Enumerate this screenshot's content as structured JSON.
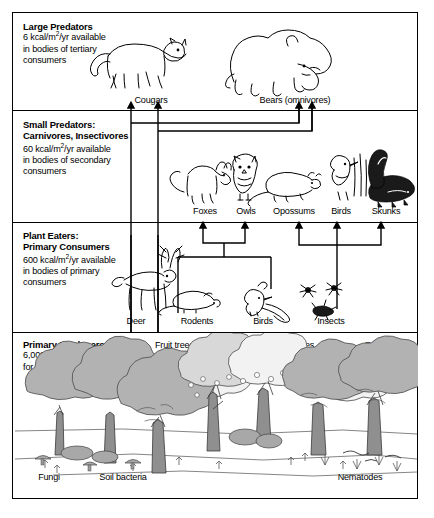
{
  "diagram": {
    "accent_color": "#000000",
    "background_color": "#ffffff"
  },
  "tiers": [
    {
      "id": "large-predators",
      "title": "Large Predators",
      "line1_pre": "6 kcal/m",
      "line1_sup": "2",
      "line1_post": "/yr available",
      "line2": "in bodies of tertiary",
      "line3": "consumers",
      "organisms": [
        {
          "name": "Cougars",
          "icon": "cougar-icon"
        },
        {
          "name": "Bears (omnivores)",
          "icon": "bear-icon"
        }
      ]
    },
    {
      "id": "small-predators",
      "title": "Small Predators:",
      "title2": "Carnivores, Insectivores",
      "line1_pre": "60 kcal/m",
      "line1_sup": "2",
      "line1_post": "/yr available",
      "line2": "in bodies of secondary",
      "line3": "consumers",
      "organisms": [
        {
          "name": "Foxes",
          "icon": "fox-icon"
        },
        {
          "name": "Owls",
          "icon": "owl-icon"
        },
        {
          "name": "Opossums",
          "icon": "opossum-icon"
        },
        {
          "name": "Birds",
          "icon": "bird-icon"
        },
        {
          "name": "Skunks",
          "icon": "skunk-icon"
        }
      ]
    },
    {
      "id": "plant-eaters",
      "title": "Plant Eaters:",
      "title2": "Primary Consumers",
      "line1_pre": "600 kcal/m",
      "line1_sup": "2",
      "line1_post": "/yr available",
      "line2": "in bodies of primary",
      "line3": "consumers",
      "organisms": [
        {
          "name": "Deer",
          "icon": "deer-icon"
        },
        {
          "name": "Rodents",
          "icon": "rodent-icon"
        },
        {
          "name": "Birds",
          "icon": "jay-icon"
        },
        {
          "name": "Insects",
          "icon": "insect-icon"
        }
      ]
    },
    {
      "id": "primary-producers",
      "title": "Primary Producers",
      "line1_pre": "6,000 kcal/m",
      "line1_sup": "2",
      "line1_post": "/yr available",
      "line2": "for animals to eat",
      "plant_groups": [
        {
          "line1": "Fruit trees",
          "line2": "Deciduous trees"
        },
        {
          "line1": "Berry bushes",
          "line2": "Fungi"
        },
        {
          "line1": "Ferns",
          "line2": "Flowers"
        }
      ],
      "decomposers": [
        {
          "name": "Fungi"
        },
        {
          "name": "Soil bacteria"
        },
        {
          "name": "Nematodes"
        }
      ]
    }
  ]
}
